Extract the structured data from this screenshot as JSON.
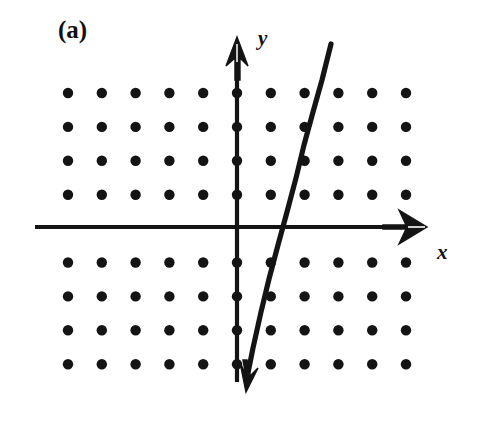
{
  "figure": {
    "panel_label": "(a)",
    "background_color": "#ffffff",
    "ink_color": "#141414",
    "width": 486,
    "height": 434
  },
  "axes": {
    "y": {
      "label": "y",
      "name": "vertical-axis",
      "x_px": 237,
      "top_px": 38,
      "bottom_px": 382,
      "arrow": "up"
    },
    "x": {
      "label": "x",
      "name": "horizontal-axis",
      "y_px": 227,
      "left_px": 35,
      "right_px": 426,
      "arrow": "right"
    },
    "dash_mark": "-"
  },
  "chart_data": {
    "type": "scatter",
    "title": "(a)",
    "xlabel": "x",
    "ylabel": "y",
    "grid": false,
    "lattice": {
      "columns": 11,
      "rows": 8,
      "x_start_px": 68,
      "y_start_px": 93,
      "spacing_x_px": 33.8,
      "spacing_y_px": 33.9,
      "dot_radius_px": 5.2,
      "skipped_row_index_at_axis": 4,
      "x_values": [
        -5,
        -4,
        -3,
        -2,
        -1,
        0,
        1,
        2,
        3,
        4,
        5
      ],
      "y_values": [
        4,
        3,
        2,
        1,
        -1,
        -2,
        -3,
        -4
      ]
    },
    "line": {
      "name": "plotted-line",
      "x1_px": 331,
      "y1_px": 44,
      "x2_px": 247,
      "y2_px": 392,
      "stroke_width_px": 5,
      "slope_lattice": -2,
      "x_intercept_lattice": 1,
      "passes_through_points": [
        [
          2,
          3
        ],
        [
          1.5,
          2
        ],
        [
          1,
          0
        ],
        [
          0.5,
          -1
        ]
      ],
      "arrow": "down-left"
    }
  }
}
